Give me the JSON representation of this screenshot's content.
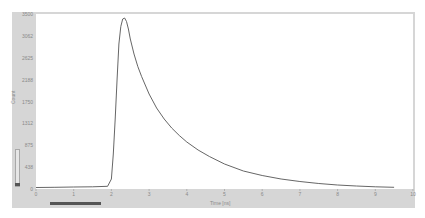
{
  "chart_data": {
    "type": "line",
    "title": "",
    "xlabel": "Time [ns]",
    "ylabel": "Count",
    "xlim": [
      0,
      10
    ],
    "ylim": [
      0,
      3500
    ],
    "x_ticks": [
      "0",
      "1",
      "2",
      "3",
      "4",
      "5",
      "6",
      "7",
      "8",
      "9",
      "10"
    ],
    "y_ticks": [
      "3500",
      "3062",
      "2625",
      "2188",
      "1750",
      "1312",
      "875",
      "438",
      "0"
    ],
    "grid": false,
    "legend": null,
    "series": [
      {
        "name": "decay",
        "color": "#555555",
        "x": [
          0,
          0.5,
          1.0,
          1.5,
          1.9,
          2.0,
          2.05,
          2.1,
          2.15,
          2.2,
          2.25,
          2.3,
          2.35,
          2.4,
          2.45,
          2.5,
          2.6,
          2.7,
          2.8,
          3.0,
          3.2,
          3.4,
          3.6,
          3.8,
          4.0,
          4.3,
          4.6,
          5.0,
          5.5,
          6.0,
          6.5,
          7.0,
          7.5,
          8.0,
          8.5,
          9.0,
          9.5
        ],
        "y": [
          30,
          35,
          40,
          45,
          55,
          200,
          700,
          1400,
          2200,
          2900,
          3250,
          3400,
          3420,
          3350,
          3200,
          3000,
          2700,
          2450,
          2250,
          1900,
          1620,
          1400,
          1220,
          1070,
          940,
          780,
          650,
          500,
          360,
          270,
          200,
          150,
          110,
          80,
          60,
          45,
          35
        ]
      }
    ]
  },
  "axes": {
    "x_title": "Time [ns]",
    "y_title": "Count"
  },
  "colors": {
    "frame": "#d6d6d6",
    "plot_bg": "#ffffff",
    "line": "#555555",
    "scroll_thumb": "#555555"
  }
}
